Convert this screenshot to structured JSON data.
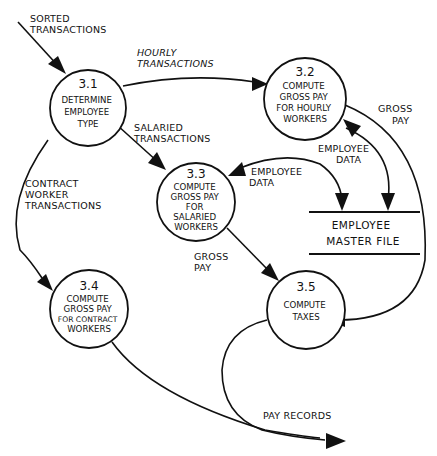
{
  "diagram": {
    "type": "data-flow-diagram",
    "processes": [
      {
        "id": "3.1",
        "number": "3.1",
        "lines": [
          "DETERMINE",
          "EMPLOYEE",
          "TYPE"
        ]
      },
      {
        "id": "3.2",
        "number": "3.2",
        "lines": [
          "COMPUTE",
          "GROSS PAY",
          "FOR HOURLY",
          "WORKERS"
        ]
      },
      {
        "id": "3.3",
        "number": "3.3",
        "lines": [
          "COMPUTE",
          "GROSS PAY",
          "FOR",
          "SALARIED",
          "WORKERS"
        ]
      },
      {
        "id": "3.4",
        "number": "3.4",
        "lines": [
          "COMPUTE",
          "GROSS PAY",
          "FOR CONTRACT",
          "WORKERS"
        ]
      },
      {
        "id": "3.5",
        "number": "3.5",
        "lines": [
          "COMPUTE",
          "TAXES"
        ]
      }
    ],
    "data_store": {
      "lines": [
        "EMPLOYEE",
        "MASTER FILE"
      ]
    },
    "flows": [
      {
        "from": "external",
        "to": "3.1",
        "lines": [
          "SORTED",
          "TRANSACTIONS"
        ]
      },
      {
        "from": "3.1",
        "to": "3.2",
        "lines": [
          "HOURLY",
          "TRANSACTIONS"
        ]
      },
      {
        "from": "3.1",
        "to": "3.3",
        "lines": [
          "SALARIED",
          "TRANSACTIONS"
        ]
      },
      {
        "from": "3.1",
        "to": "3.4",
        "lines": [
          "CONTRACT",
          "WORKER",
          "TRANSACTIONS"
        ]
      },
      {
        "from": "employee-master-file",
        "to": "3.2",
        "lines": [
          "EMPLOYEE",
          "DATA"
        ],
        "bidirectional": true
      },
      {
        "from": "employee-master-file",
        "to": "3.3",
        "lines": [
          "EMPLOYEE",
          "DATA"
        ],
        "bidirectional": true
      },
      {
        "from": "3.2",
        "to": "3.5",
        "lines": [
          "GROSS",
          "PAY"
        ]
      },
      {
        "from": "3.3",
        "to": "3.5",
        "lines": [
          "GROSS",
          "PAY"
        ]
      },
      {
        "from": "3.4",
        "to": "output",
        "lines": []
      },
      {
        "from": "3.5",
        "to": "output",
        "lines": [
          "PAY RECORDS"
        ]
      }
    ]
  }
}
